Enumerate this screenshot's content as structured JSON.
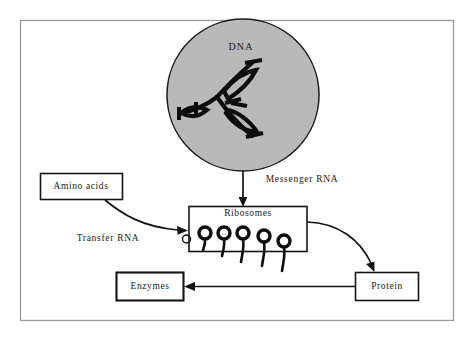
{
  "figure": {
    "title_text": "",
    "background_color": "#ffffff",
    "frame_color": "#9a9a9a",
    "nucleus_fill": "#b9b9b9",
    "ink_color": "#0d0d0d"
  },
  "nodes": {
    "dna_label": "DNA",
    "ribosomes_label": "Ribosomes",
    "amino_acids_label": "Amino acids",
    "enzymes_label": "Enzymes",
    "protein_label": "Protein"
  },
  "edges": {
    "messenger_rna_label": "Messenger RNA",
    "transfer_rna_label": "Transfer RNA"
  },
  "diagram_flow": {
    "type": "flow-diagram",
    "steps": [
      {
        "from": "DNA",
        "to": "Ribosomes",
        "label": "Messenger RNA"
      },
      {
        "from": "Amino acids",
        "to": "Ribosomes",
        "label": "Transfer RNA"
      },
      {
        "from": "Ribosomes",
        "to": "Protein",
        "label": ""
      },
      {
        "from": "Protein",
        "to": "Enzymes",
        "label": ""
      }
    ],
    "ribosome_count": 6
  }
}
